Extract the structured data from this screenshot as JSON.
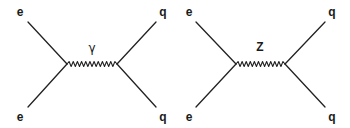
{
  "diagrams": [
    {
      "name": "photon-exchange",
      "boson": {
        "label": "γ",
        "x": 92,
        "y": 48,
        "greek": true
      },
      "vertices": {
        "left": [
          67,
          64
        ],
        "right": [
          117,
          64
        ]
      },
      "legs": [
        {
          "label": "e",
          "label_pos": [
            20,
            12
          ],
          "from": [
            28,
            22
          ],
          "to": [
            67,
            64
          ]
        },
        {
          "label": "e",
          "label_pos": [
            20,
            117
          ],
          "from": [
            28,
            107
          ],
          "to": [
            67,
            64
          ]
        },
        {
          "label": "q",
          "label_pos": [
            163,
            12
          ],
          "from": [
            156,
            22
          ],
          "to": [
            117,
            64
          ]
        },
        {
          "label": "q",
          "label_pos": [
            163,
            117
          ],
          "from": [
            156,
            107
          ],
          "to": [
            117,
            64
          ]
        }
      ],
      "wiggles": 12
    },
    {
      "name": "z-exchange",
      "boson": {
        "label": "Z",
        "x": 260,
        "y": 47,
        "greek": false
      },
      "vertices": {
        "left": [
          236,
          64
        ],
        "right": [
          285,
          64
        ]
      },
      "legs": [
        {
          "label": "e",
          "label_pos": [
            189,
            12
          ],
          "from": [
            196,
            22
          ],
          "to": [
            236,
            64
          ]
        },
        {
          "label": "e",
          "label_pos": [
            189,
            117
          ],
          "from": [
            196,
            107
          ],
          "to": [
            236,
            64
          ]
        },
        {
          "label": "q",
          "label_pos": [
            332,
            12
          ],
          "from": [
            325,
            22
          ],
          "to": [
            285,
            64
          ]
        },
        {
          "label": "q",
          "label_pos": [
            332,
            117
          ],
          "from": [
            325,
            107
          ],
          "to": [
            285,
            64
          ]
        }
      ],
      "wiggles": 12
    }
  ],
  "style": {
    "line_color": "#222222",
    "line_width": 1.3,
    "wiggle_amplitude": 2.5
  }
}
